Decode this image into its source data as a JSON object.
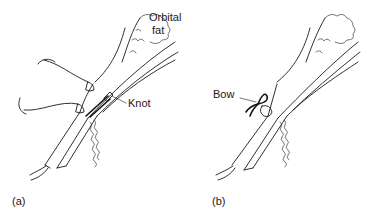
{
  "figure": {
    "panels": [
      {
        "id": "a",
        "caption": "(a)",
        "labels": {
          "orbital_fat_line1": "Orbital",
          "orbital_fat_line2": "fat",
          "knot": "Knot"
        }
      },
      {
        "id": "b",
        "caption": "(b)",
        "labels": {
          "bow": "Bow"
        }
      }
    ],
    "colors": {
      "line": "#1a1a1a",
      "background": "#ffffff"
    }
  }
}
